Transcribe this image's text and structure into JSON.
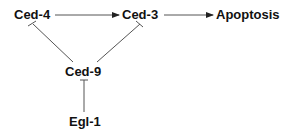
{
  "diagram": {
    "nodes": {
      "ced4": "Ced-4",
      "ced3": "Ced-3",
      "apoptosis": "Apoptosis",
      "ced9": "Ced-9",
      "egl1": "Egl-1"
    },
    "edges": [
      {
        "from": "Ced-4",
        "to": "Ced-3",
        "type": "activation"
      },
      {
        "from": "Ced-3",
        "to": "Apoptosis",
        "type": "activation"
      },
      {
        "from": "Ced-9",
        "to": "Ced-4",
        "type": "inhibition"
      },
      {
        "from": "Ced-9",
        "to": "Ced-3",
        "type": "inhibition"
      },
      {
        "from": "Egl-1",
        "to": "Ced-9",
        "type": "inhibition"
      }
    ],
    "colors": {
      "line": "#555555",
      "text": "#111111"
    }
  }
}
